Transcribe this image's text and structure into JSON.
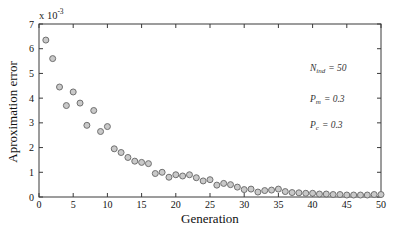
{
  "chart_data": {
    "type": "scatter",
    "title": "",
    "xlabel": "Generation",
    "ylabel": "Aproximation error",
    "y_scale_label": {
      "prefix": "x 10",
      "exponent": "-3"
    },
    "xlim": [
      0,
      50
    ],
    "ylim": [
      0,
      7
    ],
    "xticks": [
      0,
      5,
      10,
      15,
      20,
      25,
      30,
      35,
      40,
      45,
      50
    ],
    "yticks": [
      0,
      1,
      2,
      3,
      4,
      5,
      6,
      7
    ],
    "grid": false,
    "frame": "box-with-inward-ticks",
    "x": [
      1,
      2,
      3,
      4,
      5,
      6,
      7,
      8,
      9,
      10,
      11,
      12,
      13,
      14,
      15,
      16,
      17,
      18,
      19,
      20,
      21,
      22,
      23,
      24,
      25,
      26,
      27,
      28,
      29,
      30,
      31,
      32,
      33,
      34,
      35,
      36,
      37,
      38,
      39,
      40,
      41,
      42,
      43,
      44,
      45,
      46,
      47,
      48,
      49,
      50
    ],
    "y": [
      6.35,
      5.6,
      4.45,
      3.7,
      4.25,
      3.8,
      2.9,
      3.5,
      2.65,
      2.85,
      1.95,
      1.8,
      1.6,
      1.45,
      1.4,
      1.35,
      0.95,
      1.0,
      0.8,
      0.9,
      0.85,
      0.9,
      0.78,
      0.65,
      0.7,
      0.48,
      0.55,
      0.5,
      0.4,
      0.3,
      0.32,
      0.2,
      0.26,
      0.28,
      0.32,
      0.22,
      0.18,
      0.17,
      0.15,
      0.15,
      0.12,
      0.12,
      0.1,
      0.1,
      0.08,
      0.08,
      0.08,
      0.08,
      0.1,
      0.1
    ],
    "y_units_multiplier": "1e-3",
    "marker": {
      "shape": "circle",
      "radius": 3,
      "fill": "#c9c9c9",
      "stroke": "#707070"
    },
    "colors": {
      "frame": "#3a3a3a",
      "text": "#111111",
      "background": "#ffffff"
    },
    "annotations": [
      {
        "base": "N",
        "sub": "ind",
        "rest": "= 50"
      },
      {
        "base": "P",
        "sub": "m",
        "rest": "= 0.3"
      },
      {
        "base": "P",
        "sub": "c",
        "rest": "= 0.3"
      }
    ]
  }
}
